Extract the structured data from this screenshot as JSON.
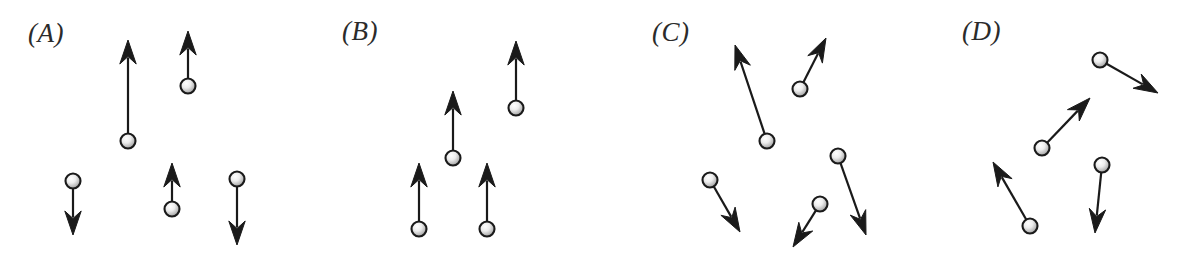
{
  "figure": {
    "width": 1190,
    "height": 261,
    "background_color": "#ffffff",
    "ink_color": "#1a1a1a",
    "ball_fill_center": "#f2f2f2",
    "ball_fill_edge": "#9a9a9a",
    "ball_stroke": "#1a1a1a",
    "ball_radius": 7.5,
    "shaft_width": 2.2
  },
  "panels": [
    {
      "id": "A",
      "label": "(A)",
      "label_x": 28,
      "label_y": 20,
      "vector_count": 5,
      "description": "five balls with vertical velocity arrows of mixed direction and length",
      "vectors": [
        {
          "name": "vector-a1",
          "x": 128,
          "y": 141,
          "tip_x": 128,
          "tip_y": 40,
          "length": 101,
          "angle_deg": 90,
          "direction": "up"
        },
        {
          "name": "vector-a2",
          "x": 188,
          "y": 86,
          "tip_x": 188,
          "tip_y": 31,
          "length": 55,
          "angle_deg": 90,
          "direction": "up"
        },
        {
          "name": "vector-a3",
          "x": 73,
          "y": 181,
          "tip_x": 73,
          "tip_y": 235,
          "length": 54,
          "angle_deg": -90,
          "direction": "down"
        },
        {
          "name": "vector-a4",
          "x": 172,
          "y": 209,
          "tip_x": 172,
          "tip_y": 163,
          "length": 46,
          "angle_deg": 90,
          "direction": "up"
        },
        {
          "name": "vector-a5",
          "x": 237,
          "y": 179,
          "tip_x": 237,
          "tip_y": 245,
          "length": 66,
          "angle_deg": -90,
          "direction": "down"
        }
      ]
    },
    {
      "id": "B",
      "label": "(B)",
      "label_x": 342,
      "label_y": 18,
      "vector_count": 4,
      "description": "four balls with equal-length arrows all pointing straight up",
      "vectors": [
        {
          "name": "vector-b1",
          "x": 516,
          "y": 108,
          "tip_x": 516,
          "tip_y": 41,
          "length": 67,
          "angle_deg": 90,
          "direction": "up"
        },
        {
          "name": "vector-b2",
          "x": 453,
          "y": 158,
          "tip_x": 453,
          "tip_y": 91,
          "length": 67,
          "angle_deg": 90,
          "direction": "up"
        },
        {
          "name": "vector-b3",
          "x": 419,
          "y": 229,
          "tip_x": 419,
          "tip_y": 163,
          "length": 66,
          "angle_deg": 90,
          "direction": "up"
        },
        {
          "name": "vector-b4",
          "x": 487,
          "y": 229,
          "tip_x": 487,
          "tip_y": 163,
          "length": 66,
          "angle_deg": 90,
          "direction": "up"
        }
      ]
    },
    {
      "id": "C",
      "label": "(C)",
      "label_x": 652,
      "label_y": 19,
      "vector_count": 5,
      "description": "five balls with slanted arrows pointing in several different directions",
      "vectors": [
        {
          "name": "vector-c1",
          "x": 767,
          "y": 141,
          "tip_x": 735,
          "tip_y": 45,
          "length": 101,
          "angle_deg": 108,
          "direction": "up-left"
        },
        {
          "name": "vector-c2",
          "x": 800,
          "y": 89,
          "tip_x": 826,
          "tip_y": 38,
          "length": 57,
          "angle_deg": 63,
          "direction": "up-right"
        },
        {
          "name": "vector-c3",
          "x": 710,
          "y": 180,
          "tip_x": 740,
          "tip_y": 232,
          "length": 60,
          "angle_deg": -60,
          "direction": "down-right"
        },
        {
          "name": "vector-c4",
          "x": 820,
          "y": 204,
          "tip_x": 793,
          "tip_y": 247,
          "length": 51,
          "angle_deg": -122,
          "direction": "down-left"
        },
        {
          "name": "vector-c5",
          "x": 838,
          "y": 156,
          "tip_x": 866,
          "tip_y": 235,
          "length": 84,
          "angle_deg": -70,
          "direction": "down-right"
        }
      ]
    },
    {
      "id": "D",
      "label": "(D)",
      "label_x": 962,
      "label_y": 18,
      "vector_count": 4,
      "description": "four balls with slanted arrows pointing in several different directions",
      "vectors": [
        {
          "name": "vector-d1",
          "x": 1100,
          "y": 60,
          "tip_x": 1158,
          "tip_y": 93,
          "length": 67,
          "angle_deg": -30,
          "direction": "down-right"
        },
        {
          "name": "vector-d2",
          "x": 1042,
          "y": 148,
          "tip_x": 1090,
          "tip_y": 98,
          "length": 69,
          "angle_deg": 46,
          "direction": "up-right"
        },
        {
          "name": "vector-d3",
          "x": 1030,
          "y": 226,
          "tip_x": 993,
          "tip_y": 162,
          "length": 74,
          "angle_deg": 120,
          "direction": "up-left"
        },
        {
          "name": "vector-d4",
          "x": 1102,
          "y": 165,
          "tip_x": 1095,
          "tip_y": 233,
          "length": 68,
          "angle_deg": -84,
          "direction": "down"
        }
      ]
    }
  ]
}
